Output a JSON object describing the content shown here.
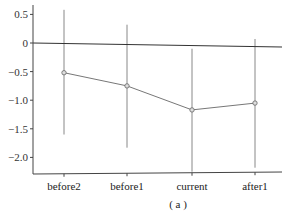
{
  "chart_data": {
    "type": "line",
    "title": "",
    "caption": "( a )",
    "xlabel": "",
    "ylabel": "",
    "categories": [
      "before2",
      "before1",
      "current",
      "after1"
    ],
    "series": [
      {
        "name": "estimate",
        "values": [
          -0.52,
          -0.75,
          -1.17,
          -1.05
        ],
        "ci_upper": [
          0.58,
          0.32,
          -0.1,
          0.07
        ],
        "ci_lower": [
          -1.6,
          -1.83,
          -2.25,
          -2.18
        ]
      }
    ],
    "yticks": [
      0.5,
      0,
      -0.5,
      -1.0,
      -1.5,
      -2.0
    ],
    "ytick_labels": [
      "0.5",
      "0",
      "−0.5",
      "−1.0",
      "−1.5",
      "−2.0"
    ],
    "ylim": [
      -2.3,
      0.65
    ],
    "reference_line": 0,
    "grid": false,
    "legend": "none",
    "colors": {
      "line": "#777777",
      "errorbar": "#888888",
      "zero_line": "#333333",
      "axis": "#444444"
    }
  }
}
